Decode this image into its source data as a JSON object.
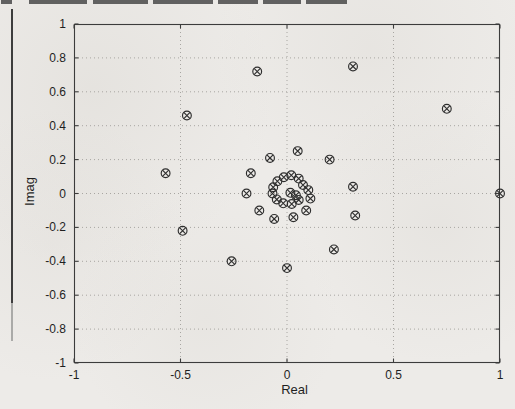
{
  "page": {
    "background": "#edebe8",
    "ink_color": "#2e2e2e",
    "axis_color": "#3c3c3c",
    "grid_color": "#a8a6a2",
    "header_segments": [
      {
        "x": 1,
        "w": 11
      },
      {
        "x": 29,
        "w": 58
      },
      {
        "x": 93,
        "w": 55
      },
      {
        "x": 153,
        "w": 60
      },
      {
        "x": 218,
        "w": 40
      },
      {
        "x": 263,
        "w": 38
      },
      {
        "x": 306,
        "w": 41
      }
    ]
  },
  "chart_data": {
    "type": "scatter",
    "title": "",
    "xlabel": "Real",
    "ylabel": "Imag",
    "xlim": [
      -1,
      1
    ],
    "ylim": [
      -1,
      1
    ],
    "x_ticks": [
      -1,
      -0.5,
      0,
      0.5,
      1
    ],
    "x_tick_labels": [
      "-1",
      "-0.5",
      "0",
      "0.5",
      "1"
    ],
    "y_ticks": [
      1,
      0.8,
      0.6,
      0.4,
      0.2,
      0,
      -0.2,
      -0.4,
      -0.6,
      -0.8,
      -1
    ],
    "y_tick_labels": [
      "1",
      "0.8",
      "0.6",
      "0.4",
      "0.2",
      "0",
      "-0.2",
      "-0.4",
      "-0.6",
      "-0.8",
      "-1"
    ],
    "grid": true,
    "legend": null,
    "marker": "circle-x",
    "points": [
      [
        1.0,
        0.0
      ],
      [
        0.75,
        0.5
      ],
      [
        0.31,
        0.75
      ],
      [
        -0.14,
        0.72
      ],
      [
        -0.47,
        0.46
      ],
      [
        -0.57,
        0.12
      ],
      [
        -0.49,
        -0.22
      ],
      [
        -0.26,
        -0.4
      ],
      [
        0.0,
        -0.44
      ],
      [
        0.22,
        -0.33
      ],
      [
        0.32,
        -0.13
      ],
      [
        0.31,
        0.04
      ],
      [
        0.2,
        0.2
      ],
      [
        0.05,
        0.25
      ],
      [
        -0.08,
        0.21
      ],
      [
        -0.17,
        0.12
      ],
      [
        -0.19,
        0.0
      ],
      [
        -0.13,
        -0.1
      ],
      [
        -0.06,
        -0.15
      ],
      [
        0.03,
        -0.14
      ],
      [
        0.09,
        -0.1
      ],
      [
        0.11,
        -0.03
      ],
      [
        0.1,
        0.02
      ],
      [
        0.075,
        0.05
      ],
      [
        0.055,
        0.088
      ],
      [
        0.02,
        0.108
      ],
      [
        -0.015,
        0.096
      ],
      [
        -0.045,
        0.072
      ],
      [
        -0.065,
        0.037
      ],
      [
        -0.068,
        0.0
      ],
      [
        -0.048,
        -0.035
      ],
      [
        -0.018,
        -0.058
      ],
      [
        0.022,
        -0.062
      ],
      [
        0.055,
        -0.038
      ],
      [
        0.042,
        -0.01
      ],
      [
        0.016,
        0.004
      ]
    ]
  }
}
